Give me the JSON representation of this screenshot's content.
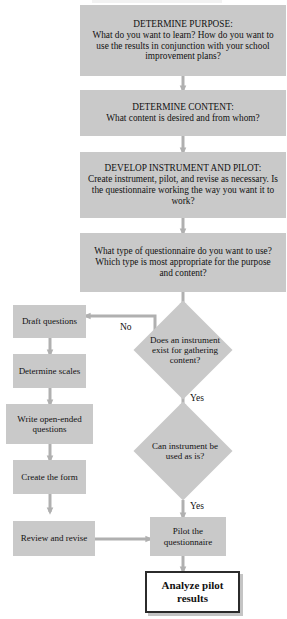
{
  "diagram": {
    "type": "flowchart",
    "colors": {
      "node_fill": "#c9c9c9",
      "final_fill": "#ffffff",
      "final_border": "#2b2b2b",
      "connector": "#b0b0b0",
      "text": "#111111"
    },
    "nodes": {
      "determine_purpose": "DETERMINE PURPOSE:\nWhat do you want to learn? How do you want to use the results in conjunction with your school improvement plans?",
      "determine_purpose_heading": "DETERMINE PURPOSE:",
      "determine_purpose_body": "What do you want to learn? How do you want to use the results in conjunction with your school improvement plans?",
      "determine_content_heading": "DETERMINE CONTENT:",
      "determine_content_body": "What content is desired and from whom?",
      "develop_instrument_heading": "DEVELOP INSTRUMENT AND PILOT:",
      "develop_instrument_body": "Create instrument, pilot, and revise as necessary. Is the questionnaire working the way you want it to work?",
      "questionnaire_type": "What type of questionnaire do you want to use? Which type is most appropriate for the purpose and content?",
      "draft_questions": "Draft questions",
      "determine_scales": "Determine scales",
      "write_open_ended": "Write open-ended questions",
      "create_form": "Create the form",
      "review_revise": "Review and revise",
      "pilot_questionnaire": "Pilot the questionnaire",
      "analyze_results": "Analyze pilot results"
    },
    "decisions": {
      "instrument_exists": "Does an instrument exist for gathering content?",
      "instrument_usable": "Can instrument be used as is?"
    },
    "edge_labels": {
      "no_to_draft": "No",
      "yes_to_usable": "Yes",
      "yes_to_pilot": "Yes"
    }
  }
}
